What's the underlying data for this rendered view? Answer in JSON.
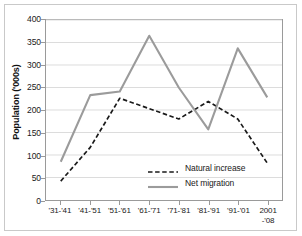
{
  "chart_data": {
    "type": "line",
    "title": "",
    "xlabel": "",
    "ylabel": "Population ('000s)",
    "categories": [
      "'31-'41",
      "'41-'51",
      "'51-'61",
      "'61-'71",
      "'71-'81",
      "'81-'91",
      "'91-'01",
      "2001\n-'08"
    ],
    "ylim": [
      0,
      400
    ],
    "yticks": [
      0,
      50,
      100,
      150,
      200,
      250,
      300,
      350,
      400
    ],
    "ytick_labels": [
      "0",
      "50",
      "100",
      "150",
      "200",
      "250",
      "300",
      "350",
      "400"
    ],
    "grid": true,
    "legend_position": "inside-lower-right",
    "series": [
      {
        "name": "Natural increase",
        "style": "dashed",
        "color": "#1a1a1a",
        "values": [
          42,
          117,
          226,
          203,
          180,
          219,
          180,
          82
        ]
      },
      {
        "name": "Net migration",
        "style": "solid",
        "color": "#9b9b9b",
        "values": [
          85,
          233,
          241,
          365,
          250,
          157,
          337,
          228
        ]
      }
    ]
  },
  "axis": {
    "y_title": "Population ('000s)",
    "x_tick_labels": [
      {
        "line1": "'31-'41",
        "line2": ""
      },
      {
        "line1": "'41-'51",
        "line2": ""
      },
      {
        "line1": "'51-'61",
        "line2": ""
      },
      {
        "line1": "'61-'71",
        "line2": ""
      },
      {
        "line1": "'71-'81",
        "line2": ""
      },
      {
        "line1": "'81-'91",
        "line2": ""
      },
      {
        "line1": "'91-'01",
        "line2": ""
      },
      {
        "line1": "2001",
        "line2": "-'08"
      }
    ]
  },
  "legend": {
    "entries": [
      {
        "label": "Natural increase",
        "color": "#1a1a1a",
        "style": "dashed"
      },
      {
        "label": "Net migration",
        "color": "#9b9b9b",
        "style": "solid"
      }
    ]
  },
  "colors": {
    "natural_increase": "#1a1a1a",
    "net_migration": "#9b9b9b",
    "gridline": "#dcdcdc",
    "axis": "#9a9a9a",
    "frame": "#c9c9c9",
    "background": "#ffffff"
  }
}
